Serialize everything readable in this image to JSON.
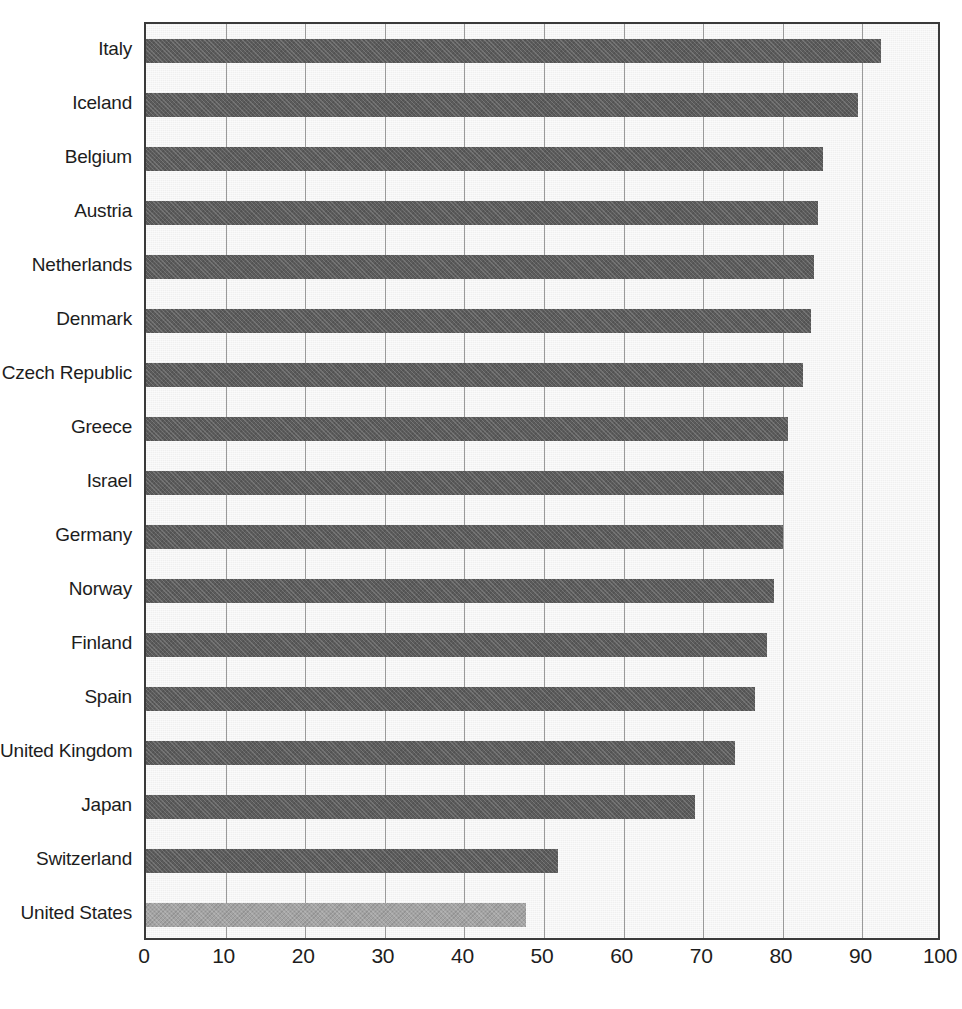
{
  "chart_data": {
    "type": "bar",
    "orientation": "horizontal",
    "title": "",
    "subtitle": "",
    "xlabel": "",
    "ylabel": "",
    "xlim": [
      0,
      100
    ],
    "xticks": [
      0,
      10,
      20,
      30,
      40,
      50,
      60,
      70,
      80,
      90,
      100
    ],
    "xtick_labels": [
      "0",
      "10",
      "20",
      "30",
      "40",
      "50",
      "60",
      "70",
      "80",
      "90",
      "100"
    ],
    "grid": "vertical",
    "legend": "none",
    "annotations": [],
    "categories": [
      "Italy",
      "Iceland",
      "Belgium",
      "Austria",
      "Netherlands",
      "Denmark",
      "Czech Republic",
      "Greece",
      "Israel",
      "Germany",
      "Norway",
      "Finland",
      "Spain",
      "United Kingdom",
      "Japan",
      "Switzerland",
      "United States"
    ],
    "values": [
      92.3,
      89.5,
      85.0,
      84.4,
      83.9,
      83.6,
      82.5,
      80.6,
      80.1,
      80.0,
      78.9,
      78.0,
      76.5,
      74.0,
      69.0,
      51.8,
      47.8
    ],
    "highlighted_category": "United States",
    "colors": {
      "bar": "#5b5b5b",
      "bar_highlight": "#a3a3a3",
      "plot_background": "#f0f0f0",
      "gridline": "#9a9a9a",
      "axis_frame": "#3a3a3a",
      "text": "#1d1d1d"
    }
  }
}
